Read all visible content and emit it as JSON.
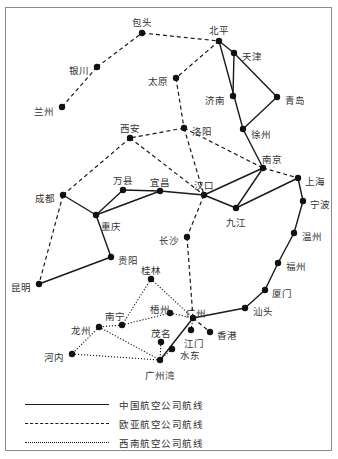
{
  "map": {
    "title": "",
    "cities": [
      {
        "id": "baotou",
        "name": "包头",
        "x": 142,
        "y": 33,
        "lx": 142,
        "ly": 22,
        "anchor": "middle"
      },
      {
        "id": "beiping",
        "name": "北平",
        "x": 219,
        "y": 41,
        "lx": 219,
        "ly": 30,
        "anchor": "middle"
      },
      {
        "id": "tianjin",
        "name": "天津",
        "x": 234,
        "y": 53,
        "lx": 242,
        "ly": 56,
        "anchor": "start"
      },
      {
        "id": "yinchuan",
        "name": "银川",
        "x": 97,
        "y": 67,
        "lx": 89,
        "ly": 70,
        "anchor": "end"
      },
      {
        "id": "taiyuan",
        "name": "太原",
        "x": 176,
        "y": 78,
        "lx": 168,
        "ly": 81,
        "anchor": "end"
      },
      {
        "id": "jinan",
        "name": "济南",
        "x": 233,
        "y": 96,
        "lx": 225,
        "ly": 100,
        "anchor": "end"
      },
      {
        "id": "qingdao",
        "name": "青岛",
        "x": 277,
        "y": 97,
        "lx": 285,
        "ly": 100,
        "anchor": "start"
      },
      {
        "id": "lanzhou",
        "name": "兰州",
        "x": 62,
        "y": 107,
        "lx": 54,
        "ly": 111,
        "anchor": "end"
      },
      {
        "id": "xuzhou",
        "name": "徐州",
        "x": 243,
        "y": 129,
        "lx": 251,
        "ly": 134,
        "anchor": "start"
      },
      {
        "id": "xian",
        "name": "西安",
        "x": 130,
        "y": 138,
        "lx": 130,
        "ly": 128,
        "anchor": "middle"
      },
      {
        "id": "luoyang",
        "name": "洛阳",
        "x": 184,
        "y": 128,
        "lx": 192,
        "ly": 131,
        "anchor": "start"
      },
      {
        "id": "nanjing",
        "name": "南京",
        "x": 263,
        "y": 168,
        "lx": 272,
        "ly": 159,
        "anchor": "middle"
      },
      {
        "id": "shanghai",
        "name": "上海",
        "x": 298,
        "y": 178,
        "lx": 305,
        "ly": 181,
        "anchor": "start"
      },
      {
        "id": "chengdu",
        "name": "成都",
        "x": 63,
        "y": 195,
        "lx": 55,
        "ly": 198,
        "anchor": "end"
      },
      {
        "id": "wanxian",
        "name": "万县",
        "x": 123,
        "y": 190,
        "lx": 123,
        "ly": 180,
        "anchor": "middle"
      },
      {
        "id": "yichang",
        "name": "宜昌",
        "x": 160,
        "y": 191,
        "lx": 160,
        "ly": 182,
        "anchor": "middle"
      },
      {
        "id": "hankou",
        "name": "汉口",
        "x": 204,
        "y": 195,
        "lx": 204,
        "ly": 185,
        "anchor": "middle"
      },
      {
        "id": "ningbo",
        "name": "宁波",
        "x": 303,
        "y": 201,
        "lx": 310,
        "ly": 204,
        "anchor": "start"
      },
      {
        "id": "chongqing",
        "name": "重庆",
        "x": 96,
        "y": 215,
        "lx": 101,
        "ly": 226,
        "anchor": "start"
      },
      {
        "id": "jiujiang",
        "name": "九江",
        "x": 236,
        "y": 208,
        "lx": 236,
        "ly": 222,
        "anchor": "middle"
      },
      {
        "id": "changsha",
        "name": "长沙",
        "x": 187,
        "y": 237,
        "lx": 179,
        "ly": 240,
        "anchor": "end"
      },
      {
        "id": "wenzhou",
        "name": "温州",
        "x": 294,
        "y": 233,
        "lx": 302,
        "ly": 236,
        "anchor": "start"
      },
      {
        "id": "guiyang",
        "name": "贵阳",
        "x": 111,
        "y": 257,
        "lx": 118,
        "ly": 260,
        "anchor": "start"
      },
      {
        "id": "fuzhou",
        "name": "福州",
        "x": 278,
        "y": 263,
        "lx": 286,
        "ly": 266,
        "anchor": "start"
      },
      {
        "id": "guilin",
        "name": "桂林",
        "x": 151,
        "y": 279,
        "lx": 151,
        "ly": 270,
        "anchor": "middle"
      },
      {
        "id": "kunming",
        "name": "昆明",
        "x": 39,
        "y": 284,
        "lx": 31,
        "ly": 287,
        "anchor": "end"
      },
      {
        "id": "xiamen",
        "name": "厦门",
        "x": 265,
        "y": 290,
        "lx": 272,
        "ly": 293,
        "anchor": "start"
      },
      {
        "id": "wuzhou",
        "name": "梧州",
        "x": 170,
        "y": 313,
        "lx": 160,
        "ly": 309,
        "anchor": "middle"
      },
      {
        "id": "shantou",
        "name": "汕头",
        "x": 245,
        "y": 308,
        "lx": 253,
        "ly": 311,
        "anchor": "start"
      },
      {
        "id": "nanning",
        "name": "南宁",
        "x": 122,
        "y": 325,
        "lx": 115,
        "ly": 316,
        "anchor": "middle"
      },
      {
        "id": "guangzhou",
        "name": "广州",
        "x": 193,
        "y": 318,
        "lx": 196,
        "ly": 313,
        "anchor": "middle"
      },
      {
        "id": "longzhou",
        "name": "龙州",
        "x": 99,
        "y": 327,
        "lx": 91,
        "ly": 330,
        "anchor": "end"
      },
      {
        "id": "jiangmen",
        "name": "江门",
        "x": 191,
        "y": 330,
        "lx": 194,
        "ly": 343,
        "anchor": "middle"
      },
      {
        "id": "xianggang",
        "name": "香港",
        "x": 210,
        "y": 332,
        "lx": 217,
        "ly": 335,
        "anchor": "start"
      },
      {
        "id": "maoming",
        "name": "茂名",
        "x": 161,
        "y": 342,
        "lx": 161,
        "ly": 333,
        "anchor": "middle"
      },
      {
        "id": "shuidong",
        "name": "水东",
        "x": 172,
        "y": 349,
        "lx": 180,
        "ly": 355,
        "anchor": "start"
      },
      {
        "id": "hanoi",
        "name": "河内",
        "x": 72,
        "y": 354,
        "lx": 64,
        "ly": 357,
        "anchor": "end"
      },
      {
        "id": "guangzhouwan",
        "name": "广州湾",
        "x": 160,
        "y": 360,
        "lx": 160,
        "ly": 375,
        "anchor": "middle"
      }
    ],
    "routes": {
      "cnac": [
        [
          "beiping",
          "tianjin"
        ],
        [
          "beiping",
          "xuzhou"
        ],
        [
          "tianjin",
          "jinan"
        ],
        [
          "tianjin",
          "qingdao"
        ],
        [
          "qingdao",
          "xuzhou"
        ],
        [
          "xuzhou",
          "nanjing"
        ],
        [
          "nanjing",
          "hankou"
        ],
        [
          "nanjing",
          "jiujiang"
        ],
        [
          "jiujiang",
          "hankou"
        ],
        [
          "jiujiang",
          "shanghai"
        ],
        [
          "hankou",
          "yichang"
        ],
        [
          "yichang",
          "wanxian"
        ],
        [
          "yichang",
          "chongqing"
        ],
        [
          "wanxian",
          "chongqing"
        ],
        [
          "chongqing",
          "chengdu"
        ],
        [
          "chongqing",
          "guiyang"
        ],
        [
          "guiyang",
          "kunming"
        ],
        [
          "shanghai",
          "ningbo"
        ],
        [
          "ningbo",
          "wenzhou"
        ],
        [
          "wenzhou",
          "fuzhou"
        ],
        [
          "fuzhou",
          "xiamen"
        ],
        [
          "xiamen",
          "shantou"
        ],
        [
          "shantou",
          "guangzhou"
        ],
        [
          "guangzhou",
          "guangzhouwan"
        ]
      ],
      "eurasia": [
        [
          "lanzhou",
          "yinchuan"
        ],
        [
          "yinchuan",
          "baotou"
        ],
        [
          "baotou",
          "beiping"
        ],
        [
          "beiping",
          "taiyuan"
        ],
        [
          "taiyuan",
          "luoyang"
        ],
        [
          "luoyang",
          "xian"
        ],
        [
          "luoyang",
          "hankou"
        ],
        [
          "luoyang",
          "nanjing"
        ],
        [
          "nanjing",
          "shanghai"
        ],
        [
          "xian",
          "chengdu"
        ],
        [
          "xian",
          "hankou"
        ],
        [
          "chengdu",
          "kunming"
        ],
        [
          "hankou",
          "changsha"
        ],
        [
          "changsha",
          "guangzhou"
        ],
        [
          "guangzhou",
          "xianggang"
        ]
      ],
      "southwest": [
        [
          "guilin",
          "nanning"
        ],
        [
          "guilin",
          "guangzhou"
        ],
        [
          "nanning",
          "longzhou"
        ],
        [
          "nanning",
          "wuzhou"
        ],
        [
          "wuzhou",
          "guangzhou"
        ],
        [
          "longzhou",
          "hanoi"
        ],
        [
          "longzhou",
          "guangzhouwan"
        ],
        [
          "hanoi",
          "guangzhouwan"
        ],
        [
          "maoming",
          "guangzhouwan"
        ],
        [
          "shuidong",
          "guangzhouwan"
        ],
        [
          "jiangmen",
          "guangzhou"
        ]
      ]
    }
  },
  "legend": {
    "items": [
      {
        "style": "solid",
        "label": "中国航空公司航线"
      },
      {
        "style": "dashed",
        "label": "欧亚航空公司航线"
      },
      {
        "style": "dotted",
        "label": "西南航空公司航线"
      }
    ]
  }
}
